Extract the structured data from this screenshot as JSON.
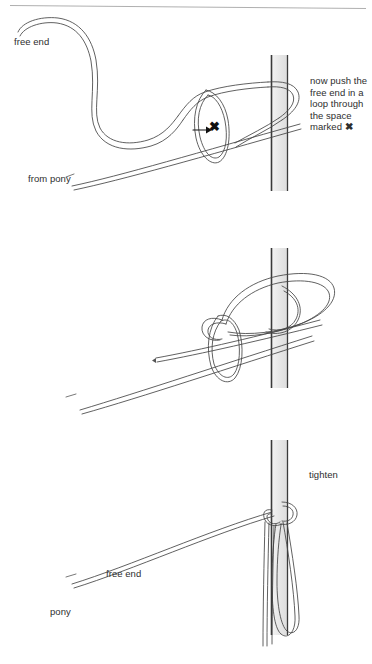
{
  "figure": {
    "title_rule_present": true,
    "type": "instructional-line-diagram",
    "background_color": "#ffffff",
    "ink_color": "#2b2b2b",
    "post_fill_color": "#e8e8e8",
    "post_edge_color": "#333333"
  },
  "panels": [
    {
      "id": "panel-1",
      "labels": {
        "free_end": "free end",
        "from_pony": "from pony",
        "x_mark": "✖"
      },
      "caption": "now push the\nfree end in a\nloop through\nthe space\nmarked"
    },
    {
      "id": "panel-2",
      "labels": {
        "tighten": "tighten",
        "free_end": "free end",
        "pony": "pony"
      }
    },
    {
      "id": "panel-3",
      "labels": {
        "pony": "pony",
        "free": "free"
      },
      "caption": "if you pull the\nfree end the\nknot falls to\npieces"
    }
  ]
}
